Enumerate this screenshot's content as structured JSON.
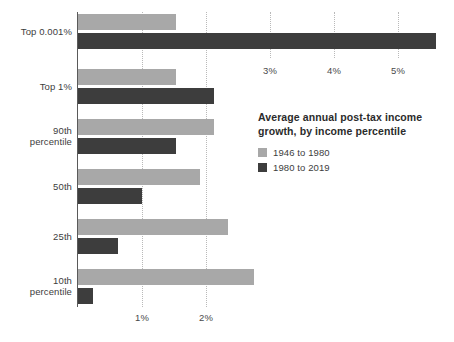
{
  "chart_data": {
    "type": "bar",
    "orientation": "horizontal",
    "title": "Average annual post-tax income growth, by income percentile",
    "xlabel": "",
    "ylabel": "",
    "xlim": [
      0,
      5.9
    ],
    "grid": true,
    "legend_position": "right-middle",
    "categories": [
      "Top 0.001%",
      "Top 1%",
      "90th percentile",
      "50th",
      "25th",
      "10th percentile"
    ],
    "series": [
      {
        "name": "1946 to 1980",
        "color": "#a8a8a8",
        "values": [
          1.53,
          1.53,
          2.13,
          1.9,
          2.35,
          2.75
        ]
      },
      {
        "name": "1980 to 2019",
        "color": "#3d3d3d",
        "values": [
          5.6,
          2.13,
          1.53,
          1.0,
          0.62,
          0.23
        ]
      }
    ],
    "top_axis": {
      "ticks": [
        3,
        4,
        5
      ],
      "tick_labels": [
        "3%",
        "4%",
        "5%"
      ]
    },
    "bottom_axis": {
      "ticks": [
        1,
        2
      ],
      "tick_labels": [
        "1%",
        "2%"
      ]
    }
  },
  "legend": {
    "title_line1": "Average annual post-tax income",
    "title_line2": "growth, by income percentile",
    "entries": [
      {
        "label": "1946 to 1980",
        "swatch": "legend-swatch-light"
      },
      {
        "label": "1980 to 2019",
        "swatch": "legend-swatch-dark"
      }
    ]
  },
  "axis_ticks": {
    "top": [
      {
        "label": "3%",
        "value": 3
      },
      {
        "label": "4%",
        "value": 4
      },
      {
        "label": "5%",
        "value": 5
      }
    ],
    "bottom": [
      {
        "label": "1%",
        "value": 1
      },
      {
        "label": "2%",
        "value": 2
      }
    ]
  },
  "category_labels": [
    {
      "line1": "Top 0.001%",
      "line2": ""
    },
    {
      "line1": "Top 1%",
      "line2": ""
    },
    {
      "line1": "90th",
      "line2": "percentile"
    },
    {
      "line1": "50th",
      "line2": ""
    },
    {
      "line1": "25th",
      "line2": ""
    },
    {
      "line1": "10th",
      "line2": "percentile"
    }
  ],
  "colors": {
    "series_light": "#a8a8a8",
    "series_dark": "#3d3d3d",
    "axis": "#5a5a5a",
    "grid": "#b9b9b9",
    "background": "#ffffff"
  }
}
